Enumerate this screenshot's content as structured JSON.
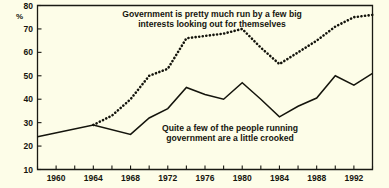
{
  "chart_data": {
    "type": "line",
    "title": "",
    "xlabel": "",
    "ylabel": "%",
    "ylim": [
      10,
      80
    ],
    "xlim": [
      1958,
      1994
    ],
    "grid": false,
    "legend": "inline-annotations",
    "y_ticks": [
      10,
      20,
      30,
      40,
      50,
      60,
      70,
      80
    ],
    "x_ticks": [
      1958,
      1960,
      1962,
      1964,
      1966,
      1968,
      1970,
      1972,
      1974,
      1976,
      1978,
      1980,
      1982,
      1984,
      1986,
      1988,
      1990,
      1992,
      1994
    ],
    "x_tick_labels": [
      "",
      "1960",
      "",
      "1964",
      "",
      "1968",
      "",
      "1972",
      "",
      "1976",
      "",
      "1980",
      "",
      "1984",
      "",
      "1988",
      "",
      "1992",
      ""
    ],
    "series": [
      {
        "name": "Government is pretty much run by a few big interests looking out for themselves",
        "style": "dotted",
        "x": [
          1964,
          1966,
          1968,
          1970,
          1972,
          1974,
          1976,
          1978,
          1980,
          1982,
          1984,
          1986,
          1988,
          1990,
          1992,
          1994
        ],
        "values": [
          29,
          33,
          40,
          50,
          53,
          66,
          67,
          68,
          70,
          62,
          55,
          60,
          65,
          71,
          75,
          76
        ]
      },
      {
        "name": "Quite a few of the people running government are a little crooked",
        "style": "solid",
        "x": [
          1958,
          1964,
          1968,
          1970,
          1972,
          1974,
          1976,
          1978,
          1980,
          1982,
          1984,
          1986,
          1988,
          1990,
          1992,
          1994
        ],
        "values": [
          24,
          29,
          25,
          32,
          36,
          45,
          42,
          40,
          47,
          40,
          32.5,
          37,
          40.5,
          50,
          46,
          51
        ]
      }
    ],
    "annotations": [
      {
        "name": "big-interests-label",
        "line1": "Government is pretty much run by a few big",
        "line2": "interests looking out for themselves"
      },
      {
        "name": "crooked-label",
        "line1": "Quite a few of the people running",
        "line2": "government are a little crooked"
      }
    ]
  },
  "axis": {
    "percent_symbol": "%"
  },
  "colors": {
    "background": "#fdfde8",
    "ink": "#14140c"
  }
}
